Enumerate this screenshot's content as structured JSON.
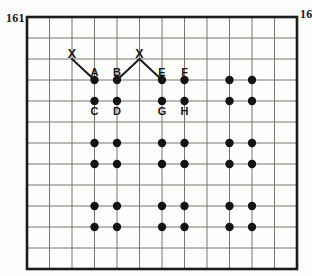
{
  "page": {
    "left_page_number": "161",
    "right_page_number": "16",
    "paper_color": "#fcfcfa",
    "ink_color": "#1a1a1a"
  },
  "figure": {
    "type": "dot-lattice-grid",
    "grid": {
      "x": 27,
      "y": 17,
      "width": 270,
      "height": 252,
      "cols": 12,
      "rows": 12,
      "line_color": "#767672",
      "border_color": "#1c1c1c",
      "paper_color": "#fdfdfb"
    },
    "dots": {
      "columns": [
        3,
        4,
        6,
        7,
        9,
        10
      ],
      "rows": [
        3,
        4,
        6,
        7,
        9,
        10
      ],
      "radius": 4.2,
      "color": "#141414"
    },
    "labels": {
      "above": [
        {
          "text": "A",
          "col": 3,
          "row": 3
        },
        {
          "text": "B",
          "col": 4,
          "row": 3
        },
        {
          "text": "E",
          "col": 6,
          "row": 3
        },
        {
          "text": "F",
          "col": 7,
          "row": 3
        }
      ],
      "below": [
        {
          "text": "C",
          "col": 3,
          "row": 4
        },
        {
          "text": "D",
          "col": 4,
          "row": 4
        },
        {
          "text": "G",
          "col": 6,
          "row": 4
        },
        {
          "text": "H",
          "col": 7,
          "row": 4
        }
      ]
    },
    "x_marks": [
      {
        "text": "X",
        "col": 2,
        "row": 2,
        "targets": [
          {
            "col": 3,
            "row": 3
          }
        ]
      },
      {
        "text": "X",
        "col": 5,
        "row": 2,
        "targets": [
          {
            "col": 4,
            "row": 3
          },
          {
            "col": 6,
            "row": 3
          }
        ]
      }
    ],
    "connector_color": "#1c1c1c"
  }
}
